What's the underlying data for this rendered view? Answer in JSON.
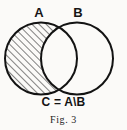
{
  "figure": {
    "caption": "Fig. 3",
    "formula": "C = A\\B",
    "labels": {
      "set_a": "A",
      "set_b": "B"
    },
    "colors": {
      "ink": "#131313",
      "paper": "#fbfaf8",
      "hatch": "#1a1a1a"
    },
    "diagram": {
      "type": "venn-two-set",
      "shaded_region": "A minus B",
      "hatch_angle_deg": 45,
      "hatch_spacing_px": 5,
      "circle_a": {
        "cx": 41,
        "cy": 58.5,
        "r": 36
      },
      "circle_b": {
        "cx": 77,
        "cy": 58.5,
        "r": 36
      },
      "stroke_width": 2
    }
  }
}
